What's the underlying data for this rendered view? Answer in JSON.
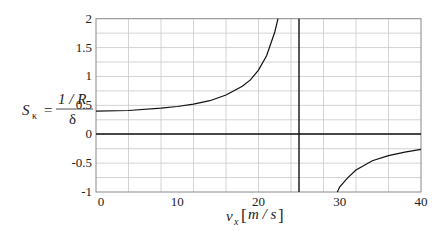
{
  "chart_data": {
    "type": "line",
    "title": "",
    "xlabel": "v_x [m/s]",
    "ylabel": "S_κ = (1/R)/δ",
    "xlim": [
      0,
      40
    ],
    "ylim": [
      -1,
      2
    ],
    "x_ticks": [
      "0",
      "10",
      "20",
      "30",
      "40"
    ],
    "y_ticks": [
      "2",
      "1.5",
      "1",
      "0.5",
      "0",
      "-0.5",
      "-1"
    ],
    "grid": true,
    "grid_x_step": 4,
    "grid_y_step": 0.25,
    "reference_lines": {
      "horizontal_y": 0,
      "vertical_x": 25
    },
    "series": [
      {
        "name": "S_kappa (branch below critical speed)",
        "x": [
          0,
          4,
          8,
          10,
          12,
          14,
          16,
          18,
          19,
          20,
          21,
          22,
          22.4
        ],
        "y": [
          0.4,
          0.41,
          0.45,
          0.48,
          0.52,
          0.58,
          0.68,
          0.83,
          0.94,
          1.11,
          1.36,
          1.77,
          2.0
        ]
      },
      {
        "name": "S_kappa (branch above critical speed)",
        "x": [
          29.7,
          30,
          31,
          32,
          34,
          36,
          38,
          40
        ],
        "y": [
          -1.0,
          -0.91,
          -0.75,
          -0.62,
          -0.46,
          -0.37,
          -0.31,
          -0.26
        ]
      }
    ]
  },
  "labels": {
    "y_main": "S",
    "y_sub": "κ",
    "y_eq": "=",
    "y_num": "1 / R",
    "y_den": "δ",
    "x_main": "v",
    "x_sub": "x",
    "x_unit": "m / s"
  }
}
